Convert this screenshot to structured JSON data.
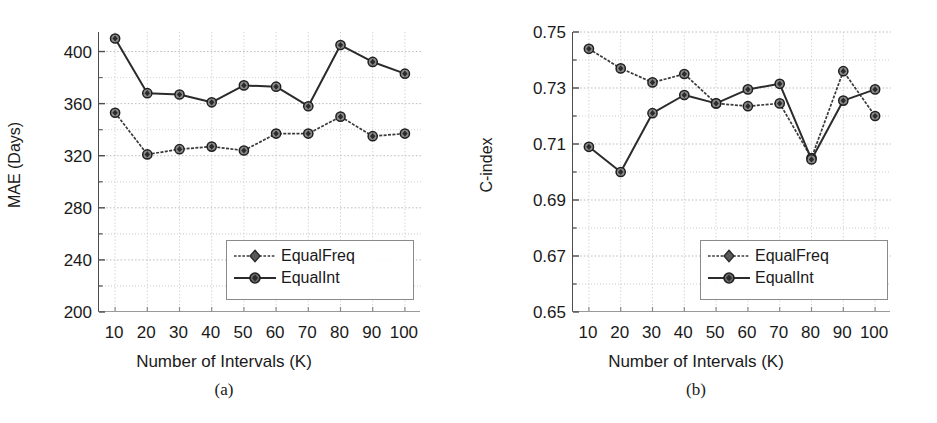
{
  "figure": {
    "panels": [
      {
        "id": "a",
        "caption": "(a)",
        "ylabel": "MAE (Days)",
        "xlabel": "Number of Intervals (K)"
      },
      {
        "id": "b",
        "caption": "(b)",
        "ylabel": "C-index",
        "xlabel": "Number of Intervals (K)"
      }
    ],
    "legend": {
      "entries": [
        {
          "label": "EqualFreq",
          "marker": "diamond-marker",
          "color": "#3a3a3a"
        },
        {
          "label": "EqualInt",
          "marker": "circle-marker",
          "color": "#2b2b2b"
        }
      ]
    }
  },
  "chart_data": [
    {
      "type": "line",
      "panel": "a",
      "title": "(a)",
      "xlabel": "Number of Intervals (K)",
      "ylabel": "MAE (Days)",
      "x": [
        10,
        20,
        30,
        40,
        50,
        60,
        70,
        80,
        90,
        100
      ],
      "xtick_labels": [
        "10",
        "20",
        "30",
        "40",
        "50",
        "60",
        "70",
        "80",
        "90",
        "100"
      ],
      "ytick_labels": [
        "200",
        "240",
        "280",
        "320",
        "360",
        "400"
      ],
      "yticks": [
        200,
        240,
        280,
        320,
        360,
        400
      ],
      "ylim": [
        200,
        415
      ],
      "xlim": [
        5,
        105
      ],
      "grid": true,
      "legend_position": "lower-right",
      "series": [
        {
          "name": "EqualFreq",
          "marker": "diamond",
          "color": "#3a3a3a",
          "values": [
            353,
            321,
            325,
            327,
            324,
            337,
            337,
            350,
            335,
            337
          ]
        },
        {
          "name": "EqualInt",
          "marker": "circle",
          "color": "#2b2b2b",
          "values": [
            410,
            368,
            367,
            361,
            374,
            373,
            358,
            405,
            392,
            383
          ]
        }
      ]
    },
    {
      "type": "line",
      "panel": "b",
      "title": "(b)",
      "xlabel": "Number of Intervals (K)",
      "ylabel": "C-index",
      "x": [
        10,
        20,
        30,
        40,
        50,
        60,
        70,
        80,
        90,
        100
      ],
      "xtick_labels": [
        "10",
        "20",
        "30",
        "40",
        "50",
        "60",
        "70",
        "80",
        "90",
        "100"
      ],
      "ytick_labels": [
        "0.65",
        "0.67",
        "0.69",
        "0.71",
        "0.73",
        "0.75"
      ],
      "yticks": [
        0.65,
        0.67,
        0.69,
        0.71,
        0.73,
        0.75
      ],
      "ylim": [
        0.65,
        0.75
      ],
      "xlim": [
        5,
        105
      ],
      "grid": true,
      "legend_position": "lower-right",
      "series": [
        {
          "name": "EqualFreq",
          "marker": "diamond",
          "color": "#3a3a3a",
          "values": [
            0.744,
            0.737,
            0.732,
            0.735,
            0.7245,
            0.7235,
            0.7245,
            0.705,
            0.736,
            0.72
          ]
        },
        {
          "name": "EqualInt",
          "marker": "circle",
          "color": "#2b2b2b",
          "values": [
            0.709,
            0.7,
            0.721,
            0.7275,
            0.7245,
            0.7295,
            0.7315,
            0.7045,
            0.7255,
            0.7295
          ]
        }
      ]
    }
  ]
}
